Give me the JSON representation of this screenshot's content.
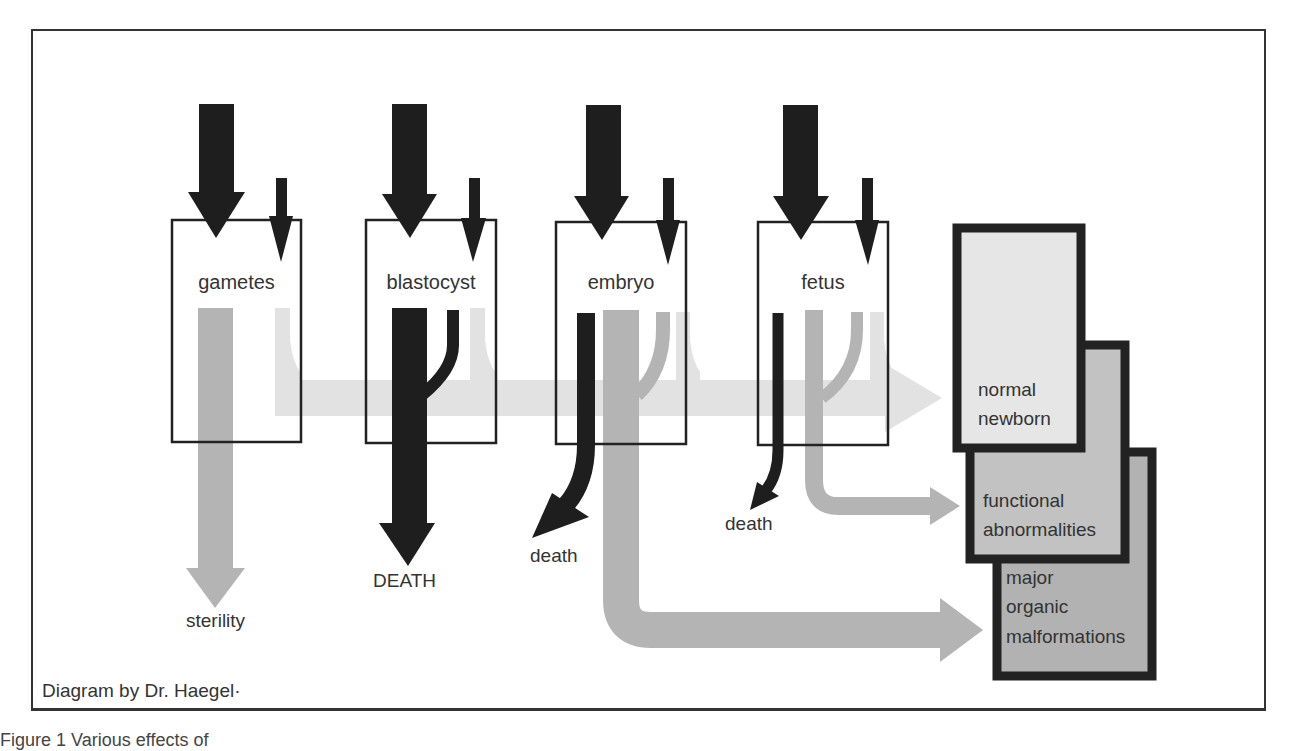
{
  "diagram": {
    "title": "",
    "stages": [
      {
        "id": "gametes",
        "label": "gametes"
      },
      {
        "id": "blastocyst",
        "label": "blastocyst"
      },
      {
        "id": "embryo",
        "label": "embryo"
      },
      {
        "id": "fetus",
        "label": "fetus"
      }
    ],
    "outcomes": [
      {
        "id": "normal",
        "label_line1": "normal",
        "label_line2": "newborn"
      },
      {
        "id": "functional",
        "label_line1": "functional",
        "label_line2": "abnormalities"
      },
      {
        "id": "major",
        "label_line1": "major",
        "label_line2": "organic",
        "label_line3": "malformations"
      }
    ],
    "terminal_labels": {
      "sterility": "sterility",
      "death_upper": "DEATH",
      "death_embryo": "death",
      "death_fetus": "death"
    },
    "credit": "Diagram by Dr. Haegel·",
    "caption": "Figure 1   Various effects of"
  },
  "colors": {
    "dark_arrow": "#1e1e1e",
    "medium_gray": "#b4b4b4",
    "light_gray": "#e2e2e2",
    "box_normal": "#e6e6e6",
    "box_functional": "#c2c2c2",
    "box_major": "#b2b2b2",
    "box_border": "#222222"
  }
}
